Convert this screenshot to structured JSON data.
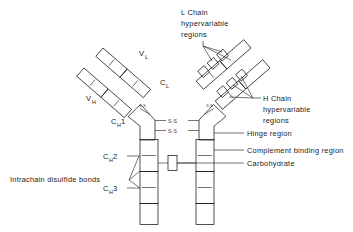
{
  "figure": {
    "kind": "immunoglobulin-structure-diagram",
    "background_color": "#ffffff",
    "line_color": "#1a1a1a"
  },
  "callouts": {
    "l_chain_hypervariable": {
      "line1": "L Chain",
      "line2": "hypervariable",
      "line3": "regions"
    },
    "h_chain_hypervariable": {
      "line1": "H Chain",
      "line2": "hypervariable",
      "line3": "regions"
    },
    "hinge_region": "Hinge region",
    "complement_binding_region": "Complement binding region",
    "carbohydrate": "Carbohydrate",
    "intrachain_disulfide_bonds": "Intrachain disulfide bonds"
  },
  "domains": {
    "v_l": {
      "base": "V",
      "sub": "L"
    },
    "c_l": {
      "base": "C",
      "sub": "L"
    },
    "v_h": {
      "base": "V",
      "sub": "H"
    },
    "c_h1": {
      "base": "C",
      "sub": "H",
      "num": "1"
    },
    "c_h2": {
      "base": "C",
      "sub": "H",
      "num": "2"
    },
    "c_h3": {
      "base": "C",
      "sub": "H",
      "num": "3"
    }
  },
  "bonds": {
    "interchain_label": "S-S",
    "hinge_bond_upper": "S-S",
    "hinge_bond_lower": "S-S",
    "fab_bond_left": "S-S",
    "fab_bond_right": "S-S"
  },
  "colors": {
    "domain_fill_light": "#fbfbfb",
    "domain_fill_shaded": "#d8d8d8",
    "domain_fill_mid": "#e8e8e8",
    "stipple_fill": "#e0e0e0",
    "outline": "#1a1a1a"
  }
}
